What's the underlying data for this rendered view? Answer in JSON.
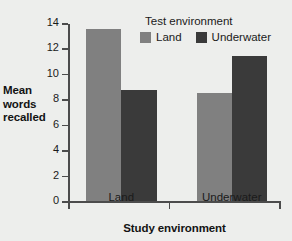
{
  "chart_data": {
    "type": "bar",
    "title": "",
    "xlabel": "Study environment",
    "ylabel": "Mean words recalled",
    "ylabel_lines": [
      "Mean",
      "words",
      "recalled"
    ],
    "categories": [
      "Land",
      "Underwater"
    ],
    "series": [
      {
        "name": "Land",
        "values": [
          13.5,
          8.5
        ],
        "color": "#808080"
      },
      {
        "name": "Underwater",
        "values": [
          8.7,
          11.4
        ],
        "color": "#3a3a3a"
      }
    ],
    "ylim": [
      0,
      14
    ],
    "yticks": [
      0,
      2,
      4,
      6,
      8,
      10,
      12,
      14
    ],
    "ytick_labels": [
      "0",
      "2",
      "4",
      "6",
      "8",
      "10",
      "12",
      "14"
    ],
    "grid": false,
    "legend": {
      "title": "Test environment",
      "position": "top-right",
      "entries": [
        {
          "label": "Land",
          "color": "#808080"
        },
        {
          "label": "Underwater",
          "color": "#3a3a3a"
        }
      ]
    },
    "colors": {
      "background": "#edeeec",
      "axis": "#4c4c4c",
      "text": "#1a1a1a",
      "bar_land": "#808080",
      "bar_underwater": "#3a3a3a"
    }
  }
}
